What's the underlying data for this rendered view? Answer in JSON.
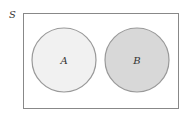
{
  "diagram": {
    "type": "venn",
    "universe": {
      "label": "S",
      "border_color": "#888888",
      "fill": "#ffffff"
    },
    "sets": [
      {
        "label": "A",
        "fill": "#f1f1f1",
        "stroke": "#999999"
      },
      {
        "label": "B",
        "fill": "#d8d8d8",
        "stroke": "#999999"
      }
    ],
    "relationship": "disjoint"
  }
}
